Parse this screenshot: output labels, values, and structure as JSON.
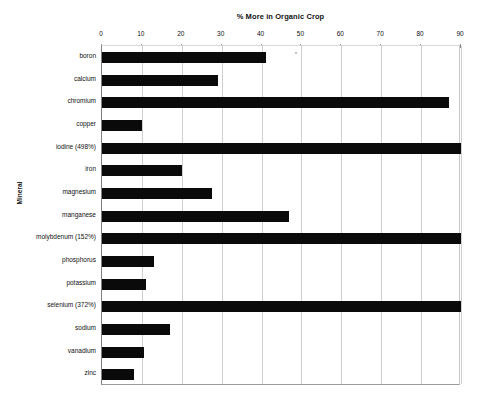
{
  "chart_data": {
    "type": "bar",
    "orientation": "horizontal",
    "title": "% More in Organic Crop",
    "xlabel": "% More in Organic Crop",
    "ylabel": "Mineral",
    "xlim": [
      0,
      90
    ],
    "xticks": [
      0,
      10,
      20,
      30,
      40,
      50,
      60,
      70,
      80,
      90
    ],
    "xtick_labels": [
      "0",
      "10",
      "20",
      "30",
      "40",
      "50",
      "60",
      "70",
      "80",
      "90"
    ],
    "grid": true,
    "legend": "none",
    "categories": [
      "boron",
      "calcium",
      "chromium",
      "copper",
      "iodine (498%)",
      "iron",
      "magnesium",
      "manganese",
      "molybdenum (152%)",
      "phosphorus",
      "potassium",
      "selenium (372%)",
      "sodium",
      "vanadium",
      "zinc"
    ],
    "values": [
      41,
      29,
      87,
      10,
      90,
      20,
      27.5,
      47,
      90,
      13,
      11,
      90,
      17,
      10.5,
      8
    ],
    "notes": [
      "iodine, molybdenum and selenium bars are clipped at the axis maximum of 90; true values are given in the category labels (498%, 152%, 372%)"
    ],
    "colors": {
      "bar": "#0a0a0a",
      "grid": "#cfcfcf",
      "axis": "#8a8a8a",
      "background": "#ffffff",
      "text": "#111111"
    }
  }
}
